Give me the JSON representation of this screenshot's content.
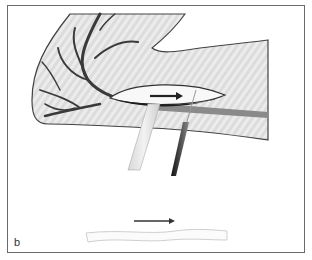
{
  "figure": {
    "panel_label": "b",
    "colors": {
      "frame": "#6a6a6a",
      "tissue_fill": "#dcdcdc",
      "tissue_stripe": "#eeeeee",
      "outline": "#444444",
      "vessel": "#3a3a3a",
      "vessel_light": "#8a8a8a",
      "arrow": "#333333"
    },
    "elements": {
      "tissue": "tissue-region",
      "vessels": "branching-vessel",
      "incision": "incision-opening",
      "retractor": "retractor",
      "instrument": "dissection-instrument",
      "direction_arrow": "direction-arrow",
      "harvested_vessel": "harvested-vessel-segment"
    }
  }
}
